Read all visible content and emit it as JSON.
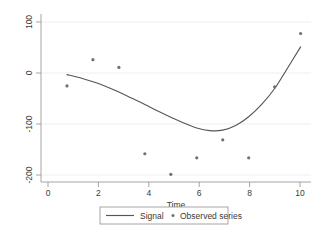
{
  "chart_data": {
    "type": "scatter",
    "title": "",
    "subtitle": "",
    "xlabel": "Time",
    "ylabel": "",
    "xlim": [
      0,
      10.4
    ],
    "ylim": [
      -215,
      112
    ],
    "xticks": [
      0,
      2,
      4,
      6,
      8,
      10
    ],
    "xtick_labels": [
      "0",
      "2",
      "4",
      "6",
      "8",
      "10"
    ],
    "yticks": [
      100,
      0,
      -100,
      -200
    ],
    "ytick_labels": [
      "100",
      "0",
      "-100",
      "-200"
    ],
    "grid": "horizontal",
    "legend_position": "below-center",
    "series": [
      {
        "name": "Signal",
        "type": "line",
        "color": "#55565a",
        "x": [
          1,
          1.5,
          2,
          2.5,
          3,
          3.5,
          4,
          4.5,
          5,
          5.5,
          6,
          6.5,
          7,
          7.5,
          8,
          8.5,
          9,
          9.5,
          10
        ],
        "values": [
          -6,
          -12,
          -20,
          -29,
          -40,
          -52,
          -64,
          -77,
          -89,
          -100,
          -110,
          -115,
          -114,
          -105,
          -88,
          -64,
          -33,
          7,
          48
        ]
      },
      {
        "name": "Observed series",
        "type": "scatter",
        "color": "#6f7072",
        "x": [
          1,
          2,
          3,
          4,
          5,
          6,
          7,
          8,
          9,
          10
        ],
        "values": [
          -28,
          23,
          8,
          -160,
          -200,
          -168,
          -133,
          -168,
          -30,
          74
        ]
      }
    ]
  },
  "legend": {
    "entries": [
      {
        "label": "Signal",
        "marker": "line"
      },
      {
        "label": "Observed series",
        "marker": "dot"
      }
    ]
  },
  "axis": {
    "x_title": "Time"
  }
}
